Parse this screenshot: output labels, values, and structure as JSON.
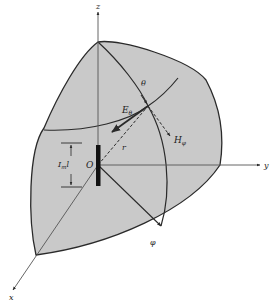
{
  "figure": {
    "colors": {
      "sphere_fill": "#c9c9c9",
      "stroke": "#2a2a2a",
      "axis": "#555555",
      "background": "#ffffff"
    }
  },
  "labels": {
    "z_axis": "z",
    "y_axis": "y",
    "x_axis": "x",
    "origin": "O",
    "theta": "θ",
    "e_theta": "E",
    "e_theta_sub": "θ",
    "h_phi": "H",
    "h_phi_sub": "φ",
    "radius": "r",
    "phi": "φ",
    "current_length": "I",
    "current_length_sub": "m",
    "current_length_tail": "l"
  }
}
